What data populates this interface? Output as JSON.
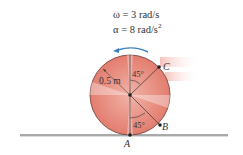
{
  "given": {
    "omega": "ω = 3 rad/s",
    "alpha_prefix": "α = 8 rad/s",
    "alpha_exp": "2"
  },
  "labels": {
    "radius": "0.5 m",
    "angle_top": "45°",
    "angle_bottom": "45°",
    "point_a": "A",
    "point_b": "B",
    "point_c": "C"
  },
  "colors": {
    "wheel_fill": "#e8877a",
    "wheel_light": "#f9d6cf",
    "wheel_outline": "#6b3b34",
    "arrow": "#3a7fc4",
    "ground": "#555555",
    "motion_blur": "#f6c9c2"
  }
}
